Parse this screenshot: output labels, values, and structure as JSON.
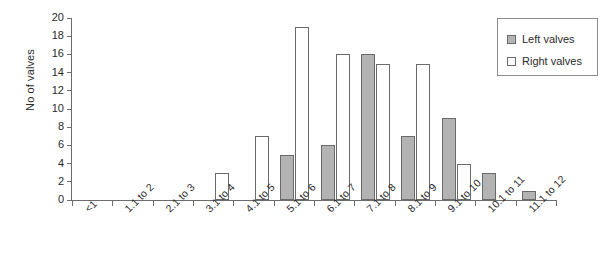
{
  "chart_data": {
    "type": "bar",
    "title": "",
    "subtitle": "",
    "xlabel": "",
    "ylabel": "No of valves",
    "categories": [
      "<1",
      "1.1 to 2",
      "2.1 to 3",
      "3.1 to 4",
      "4.1 to 5",
      "5.1 to 6",
      "6.1 to 7",
      "7.1 to 8",
      "8.1 to 9",
      "9.1 to 10",
      "10.1 to 11",
      "11.1 to 12"
    ],
    "series": [
      {
        "name": "Left valves",
        "color": "#b3b3b3",
        "values": [
          0,
          0,
          0,
          0,
          0,
          5,
          6,
          16,
          7,
          9,
          3,
          1
        ]
      },
      {
        "name": "Right valves",
        "color": "#ffffff",
        "values": [
          0,
          0,
          0,
          3,
          7,
          19,
          16,
          15,
          15,
          4,
          0,
          0
        ]
      }
    ],
    "ylim": [
      0,
      20
    ],
    "ytick_step": 2,
    "yticks": [
      "0",
      "2",
      "4",
      "6",
      "8",
      "10",
      "12",
      "14",
      "16",
      "18",
      "20"
    ],
    "grid": false,
    "legend_position": "top-right",
    "legend": [
      "Left valves",
      "Right valves"
    ]
  },
  "legend": {
    "items": [
      {
        "label": "Left valves",
        "swatch": "filled-gray-swatch"
      },
      {
        "label": "Right valves",
        "swatch": "outlined-white-swatch"
      }
    ]
  }
}
